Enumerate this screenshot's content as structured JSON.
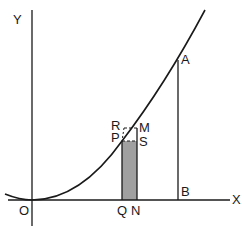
{
  "diagram": {
    "type": "area-under-curve",
    "axes": {
      "x_label": "X",
      "y_label": "Y",
      "origin_label": "O"
    },
    "points": {
      "P": "P",
      "Q": "Q",
      "R": "R",
      "S": "S",
      "M": "M",
      "N": "N",
      "A": "A",
      "B": "B"
    },
    "colors": {
      "line": "#1a1a1a",
      "shade": "#a0a0a0",
      "background": "#ffffff"
    }
  }
}
